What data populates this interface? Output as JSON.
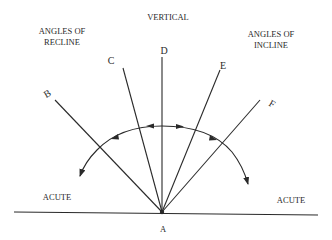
{
  "diagram": {
    "headings": {
      "vertical": "VERTICAL",
      "recline_line1": "ANGLES OF",
      "recline_line2": "RECLINE",
      "incline_line1": "ANGLES OF",
      "incline_line2": "INCLINE"
    },
    "rays": [
      {
        "label": "B",
        "x": 55,
        "y": 100,
        "lx": 47,
        "ly": 93
      },
      {
        "label": "C",
        "x": 123,
        "y": 68,
        "lx": 111,
        "ly": 60
      },
      {
        "label": "D",
        "x": 162,
        "y": 57,
        "lx": 162,
        "ly": 50
      },
      {
        "label": "E",
        "x": 220,
        "y": 70,
        "lx": 223,
        "ly": 65
      },
      {
        "label": "F",
        "x": 260,
        "y": 100,
        "lx": 269,
        "ly": 104
      }
    ],
    "origin": {
      "label": "A"
    },
    "acute_left": "ACUTE",
    "acute_right": "ACUTE",
    "colors": {
      "ink": "#2a2a2a",
      "background": "#ffffff"
    }
  }
}
